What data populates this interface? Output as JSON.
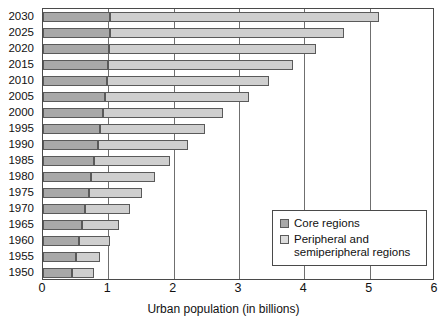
{
  "chart_data": {
    "type": "bar",
    "orientation": "horizontal",
    "stacked": true,
    "title": "",
    "xlabel": "Urban population (in billions)",
    "ylabel": "",
    "xlim": [
      0,
      6
    ],
    "xticks": [
      0,
      1,
      2,
      3,
      4,
      5,
      6
    ],
    "xtick_labels": [
      "0",
      "1",
      "2",
      "3",
      "4",
      "5",
      "6"
    ],
    "grid": "vertical",
    "legend_position": "lower-right",
    "categories": [
      "2030",
      "2025",
      "2020",
      "2015",
      "2010",
      "2005",
      "2000",
      "1995",
      "1990",
      "1985",
      "1980",
      "1975",
      "1970",
      "1965",
      "1960",
      "1955",
      "1950"
    ],
    "series": [
      {
        "name": "Core regions",
        "color": "#a8a8a8",
        "values": [
          1.02,
          1.02,
          1.01,
          1.0,
          0.98,
          0.95,
          0.92,
          0.88,
          0.84,
          0.78,
          0.74,
          0.7,
          0.65,
          0.6,
          0.55,
          0.5,
          0.45
        ]
      },
      {
        "name": "Peripheral and semiperipheral regions",
        "color": "#cfcfcf",
        "values": [
          4.13,
          3.58,
          3.17,
          2.83,
          2.48,
          2.2,
          1.83,
          1.6,
          1.38,
          1.17,
          0.98,
          0.82,
          0.68,
          0.57,
          0.47,
          0.38,
          0.33
        ]
      }
    ],
    "totals": [
      5.15,
      4.6,
      4.18,
      3.83,
      3.46,
      3.15,
      2.75,
      2.48,
      2.22,
      1.95,
      1.72,
      1.52,
      1.33,
      1.17,
      1.02,
      0.88,
      0.78
    ]
  },
  "legend": {
    "items": [
      {
        "label": "Core regions",
        "swatch": "core"
      },
      {
        "label": "Peripheral and\nsemiperipheral regions",
        "swatch": "periph"
      }
    ]
  },
  "axis": {
    "x_title": "Urban population (in billions)"
  }
}
